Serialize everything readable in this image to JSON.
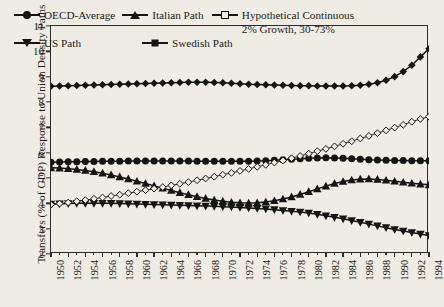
{
  "chart_data": {
    "type": "line",
    "title": "",
    "xlabel": "",
    "ylabel": "Transfers (% of GDP) Response to Union Density Paths",
    "ylim": [
      2,
      11
    ],
    "xlim": [
      1950,
      1994
    ],
    "yticks": [
      2,
      3,
      4,
      5,
      6,
      7,
      8,
      9,
      10,
      11
    ],
    "grid": false,
    "legend_position": "top-inside",
    "x": [
      1950,
      1951,
      1952,
      1953,
      1954,
      1955,
      1956,
      1957,
      1958,
      1959,
      1960,
      1961,
      1962,
      1963,
      1964,
      1965,
      1966,
      1967,
      1968,
      1969,
      1970,
      1971,
      1972,
      1973,
      1974,
      1975,
      1976,
      1977,
      1978,
      1979,
      1980,
      1981,
      1982,
      1983,
      1984,
      1985,
      1986,
      1987,
      1988,
      1989,
      1990,
      1991,
      1992,
      1993,
      1994
    ],
    "xticklabels": [
      "1950",
      "1952",
      "1954",
      "1956",
      "1958",
      "1960",
      "1962",
      "1964",
      "1966",
      "1968",
      "1970",
      "1972",
      "1974",
      "1976",
      "1978",
      "1980",
      "1982",
      "1984",
      "1986",
      "1988",
      "1990",
      "1992",
      "1994"
    ],
    "series": [
      {
        "name": "OECD-Average",
        "marker": "filled-circle",
        "values": [
          5.62,
          5.63,
          5.64,
          5.64,
          5.65,
          5.65,
          5.66,
          5.66,
          5.66,
          5.67,
          5.67,
          5.67,
          5.67,
          5.67,
          5.67,
          5.67,
          5.67,
          5.66,
          5.66,
          5.66,
          5.66,
          5.66,
          5.66,
          5.66,
          5.67,
          5.68,
          5.7,
          5.72,
          5.74,
          5.76,
          5.78,
          5.79,
          5.8,
          5.79,
          5.78,
          5.76,
          5.74,
          5.72,
          5.71,
          5.7,
          5.69,
          5.69,
          5.68,
          5.68,
          5.68
        ]
      },
      {
        "name": "US Path",
        "marker": "filled-down-triangle",
        "values": [
          3.97,
          3.98,
          3.99,
          4.0,
          4.0,
          4.0,
          4.0,
          4.0,
          3.99,
          3.98,
          3.97,
          3.96,
          3.95,
          3.94,
          3.93,
          3.92,
          3.91,
          3.9,
          3.89,
          3.88,
          3.87,
          3.86,
          3.84,
          3.82,
          3.8,
          3.78,
          3.75,
          3.72,
          3.69,
          3.66,
          3.62,
          3.57,
          3.51,
          3.45,
          3.39,
          3.32,
          3.25,
          3.18,
          3.11,
          3.04,
          2.97,
          2.91,
          2.85,
          2.79,
          2.73
        ]
      },
      {
        "name": "Italian Path",
        "marker": "filled-up-triangle",
        "values": [
          5.4,
          5.39,
          5.37,
          5.34,
          5.3,
          5.25,
          5.19,
          5.12,
          5.04,
          4.96,
          4.87,
          4.78,
          4.69,
          4.6,
          4.51,
          4.42,
          4.34,
          4.26,
          4.19,
          4.13,
          4.08,
          4.04,
          4.02,
          4.01,
          4.02,
          4.05,
          4.1,
          4.17,
          4.25,
          4.35,
          4.46,
          4.57,
          4.68,
          4.78,
          4.86,
          4.92,
          4.95,
          4.96,
          4.94,
          4.91,
          4.87,
          4.83,
          4.79,
          4.76,
          4.73
        ]
      },
      {
        "name": "Swedish Path",
        "marker": "filled-diamond",
        "values": [
          8.62,
          8.63,
          8.64,
          8.65,
          8.66,
          8.67,
          8.68,
          8.69,
          8.7,
          8.71,
          8.72,
          8.73,
          8.74,
          8.75,
          8.76,
          8.77,
          8.78,
          8.78,
          8.78,
          8.77,
          8.76,
          8.74,
          8.72,
          8.7,
          8.69,
          8.68,
          8.67,
          8.66,
          8.65,
          8.64,
          8.64,
          8.63,
          8.63,
          8.63,
          8.63,
          8.64,
          8.66,
          8.7,
          8.76,
          8.86,
          9.0,
          9.2,
          9.45,
          9.78,
          10.1
        ]
      },
      {
        "name": "Hypothetical Continuous 2% Growth, 30-73%",
        "marker": "open-diamond",
        "values": [
          3.95,
          3.99,
          4.03,
          4.08,
          4.13,
          4.18,
          4.23,
          4.29,
          4.34,
          4.4,
          4.46,
          4.52,
          4.58,
          4.64,
          4.71,
          4.77,
          4.84,
          4.91,
          4.98,
          5.05,
          5.13,
          5.2,
          5.28,
          5.36,
          5.44,
          5.52,
          5.61,
          5.69,
          5.78,
          5.87,
          5.96,
          6.06,
          6.15,
          6.25,
          6.35,
          6.45,
          6.56,
          6.66,
          6.77,
          6.88,
          6.99,
          7.1,
          7.22,
          7.33,
          7.42
        ]
      }
    ]
  },
  "legend": {
    "entries": [
      {
        "label": "OECD-Average",
        "marker": "filled-circle"
      },
      {
        "label": "Italian Path",
        "marker": "filled-up-triangle"
      },
      {
        "label": "Hypothetical Continuous 2% Growth, 30-73%",
        "marker": "open-diamond"
      },
      {
        "label": "US Path",
        "marker": "filled-down-triangle"
      },
      {
        "label": "Swedish Path",
        "marker": "filled-diamond"
      }
    ]
  }
}
